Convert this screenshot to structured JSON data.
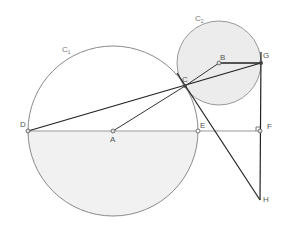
{
  "diagram": {
    "circles": [
      {
        "name": "C1",
        "label": "C",
        "subscript": "1",
        "center": "A",
        "cx": 113,
        "cy": 131,
        "r": 85,
        "fill_lower_half": true
      },
      {
        "name": "C2",
        "label": "C",
        "subscript": "2",
        "center": "B",
        "cx": 219,
        "cy": 63,
        "r": 42,
        "filled": true
      }
    ],
    "points": [
      {
        "label": "A",
        "x": 113,
        "y": 131
      },
      {
        "label": "B",
        "x": 219,
        "y": 63
      },
      {
        "label": "C",
        "x": 185,
        "y": 86
      },
      {
        "label": "D",
        "x": 28,
        "y": 131
      },
      {
        "label": "E",
        "x": 198,
        "y": 131
      },
      {
        "label": "F",
        "x": 260,
        "y": 131
      },
      {
        "label": "G",
        "x": 261,
        "y": 63
      },
      {
        "label": "H",
        "x": 260,
        "y": 200
      }
    ],
    "segments": [
      "DG",
      "AC",
      "BG",
      "CH",
      "GH",
      "DF"
    ],
    "right_angle_at": "F",
    "colors": {
      "stroke": "#222222",
      "circle": "#888888",
      "fill": "#ececec"
    }
  }
}
